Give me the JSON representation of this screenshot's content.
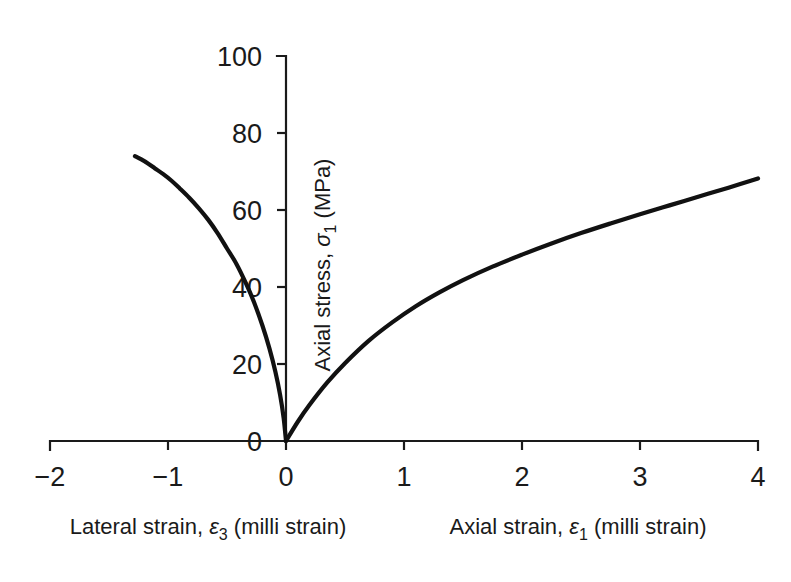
{
  "chart_data": {
    "type": "line",
    "title": "",
    "xlabel_left": "Lateral strain, ε3 (milli strain)",
    "xlabel_right": "Axial strain, ε1 (milli strain)",
    "ylabel": "Axial stress, σ1 (MPa)",
    "xlim": [
      -2,
      4
    ],
    "ylim": [
      0,
      100
    ],
    "xticks": [
      -2,
      -1,
      0,
      1,
      2,
      3,
      4
    ],
    "xtick_labels": [
      "−2",
      "−1",
      "0",
      "1",
      "2",
      "3",
      "4"
    ],
    "yticks": [
      0,
      20,
      40,
      60,
      80,
      100
    ],
    "ytick_labels": [
      "0",
      "20",
      "40",
      "60",
      "80",
      "100"
    ],
    "grid": false,
    "legend": null,
    "series": [
      {
        "name": "Lateral strain curve",
        "x": [
          0,
          -0.02,
          -0.05,
          -0.09,
          -0.14,
          -0.2,
          -0.27,
          -0.34,
          -0.42,
          -0.5,
          -0.58,
          -0.66,
          -0.74,
          -0.82,
          -0.9,
          -0.97,
          -1.04,
          -1.11,
          -1.17,
          -1.23,
          -1.28
        ],
        "y": [
          0,
          6,
          12,
          18,
          24,
          30,
          36,
          41,
          46,
          50,
          54,
          57.5,
          60.5,
          63.2,
          65.6,
          67.6,
          69.3,
          70.8,
          72.1,
          73.2,
          74.0
        ]
      },
      {
        "name": "Axial strain curve",
        "x": [
          0,
          0.1,
          0.2,
          0.35,
          0.5,
          0.7,
          0.9,
          1.1,
          1.3,
          1.5,
          1.75,
          2.0,
          2.25,
          2.5,
          2.75,
          3.0,
          3.25,
          3.5,
          3.75,
          4.0
        ],
        "y": [
          0,
          5.0,
          9.4,
          15.2,
          20.2,
          26.0,
          30.8,
          35.0,
          38.6,
          41.8,
          45.3,
          48.4,
          51.3,
          54.0,
          56.5,
          58.9,
          61.2,
          63.5,
          65.8,
          68.2
        ]
      }
    ]
  },
  "axis_labels": {
    "y_title_main": "Axial stress, ",
    "y_title_symbol": "σ",
    "y_title_sub": "1",
    "y_title_unit": " (MPa)",
    "x_left_main": "Lateral strain, ",
    "x_left_symbol": "ε",
    "x_left_sub": "3",
    "x_left_unit": " (milli strain)",
    "x_right_main": "Axial strain, ",
    "x_right_symbol": "ε",
    "x_right_sub": "1",
    "x_right_unit": " (milli strain)"
  },
  "colors": {
    "background": "#ffffff",
    "ink": "#1a1a1a",
    "curve": "#111111"
  }
}
